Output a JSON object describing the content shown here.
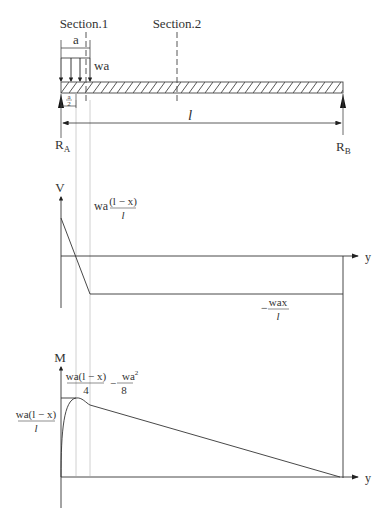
{
  "beam": {
    "section1_label": "Section.1",
    "section2_label": "Section.2",
    "load_width_label": "a",
    "load_label": "wa",
    "half_a_num": "a",
    "half_a_den": "2",
    "span_label": "l",
    "left_reaction": "R",
    "left_reaction_sub": "A",
    "right_reaction": "R",
    "right_reaction_sub": "B"
  },
  "shear_diagram": {
    "axis_label": "V",
    "x_axis_label": "y",
    "top_label_prefix": "wa",
    "top_label_num": "(l − x)",
    "top_label_den": "l",
    "bottom_label_prefix": "−",
    "bottom_label_num": "wax",
    "bottom_label_den": "l"
  },
  "moment_diagram": {
    "axis_label": "M",
    "x_axis_label": "y",
    "peak_label_num1": "wa(l − x)",
    "peak_label_den1": "4",
    "peak_label_op": "−",
    "peak_label_num2": "wa",
    "peak_label_num2_sup": "2",
    "peak_label_den2": "8",
    "left_label_num": "wa(l − x)",
    "left_label_den": "l"
  },
  "colors": {
    "line": "#444444",
    "guide": "#bbbbbb",
    "text": "#333333"
  }
}
